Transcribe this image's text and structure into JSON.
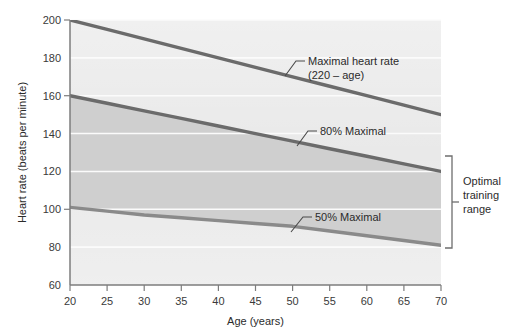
{
  "chart_data": {
    "type": "line",
    "title": "",
    "xlabel": "Age (years)",
    "ylabel": "Heart rate (beats per minute)",
    "xlim": [
      20,
      70
    ],
    "ylim": [
      60,
      200
    ],
    "xticks": [
      20,
      25,
      30,
      35,
      40,
      45,
      50,
      55,
      60,
      65,
      70
    ],
    "yticks": [
      60,
      80,
      100,
      120,
      140,
      160,
      180,
      200
    ],
    "grid": "horizontal-white-gridlines",
    "legend_position": "inline-annotations",
    "x": [
      20,
      25,
      30,
      35,
      40,
      45,
      50,
      55,
      60,
      65,
      70
    ],
    "series": [
      {
        "name": "Maximal heart rate (220 – age)",
        "values": [
          200,
          195,
          190,
          185,
          180,
          175,
          170,
          165,
          160,
          155,
          150
        ],
        "color": "#6b6b6b"
      },
      {
        "name": "80% Maximal",
        "values": [
          160,
          156,
          152,
          148,
          144,
          140,
          136,
          132,
          128,
          124,
          120
        ],
        "color": "#6b6b6b"
      },
      {
        "name": "50% Maximal",
        "values": [
          101,
          99,
          97,
          95.5,
          94,
          92.5,
          91,
          88.5,
          86,
          83.5,
          81
        ],
        "color": "#8a8a8a"
      }
    ],
    "shaded_band": {
      "label": "Optimal training range",
      "upper_series": "80% Maximal",
      "lower_series": "50% Maximal",
      "color": "#cfcfcf"
    },
    "annotations": [
      {
        "text_line1": "Maximal heart rate",
        "text_line2": "(220 – age)",
        "target_series": "Maximal heart rate (220 – age)"
      },
      {
        "text_line1": "80% Maximal",
        "text_line2": "",
        "target_series": "80% Maximal"
      },
      {
        "text_line1": "50% Maximal",
        "text_line2": "",
        "target_series": "50% Maximal"
      }
    ],
    "bracket": {
      "line1": "Optimal",
      "line2": "training",
      "line3": "range"
    }
  },
  "axes": {
    "y_title": "Heart rate (beats per minute)",
    "x_title": "Age (years)",
    "y_tick_200": "200",
    "y_tick_180": "180",
    "y_tick_160": "160",
    "y_tick_140": "140",
    "y_tick_120": "120",
    "y_tick_100": "100",
    "y_tick_80": "80",
    "y_tick_60": "60",
    "x_tick_20": "20",
    "x_tick_25": "25",
    "x_tick_30": "30",
    "x_tick_35": "35",
    "x_tick_40": "40",
    "x_tick_45": "45",
    "x_tick_50": "50",
    "x_tick_55": "55",
    "x_tick_60": "60",
    "x_tick_65": "65",
    "x_tick_70": "70"
  },
  "labels": {
    "maximal_line1": "Maximal heart rate",
    "maximal_line2": "(220 – age)",
    "eighty_percent": "80% Maximal",
    "fifty_percent": "50% Maximal",
    "bracket_line1": "Optimal",
    "bracket_line2": "training",
    "bracket_line3": "range"
  },
  "colors": {
    "plot_background": "#e8e8e8",
    "band_fill": "#cfcfcf",
    "line_dark": "#6b6b6b",
    "line_mid": "#8a8a8a",
    "gridline": "#fafafa",
    "axis": "#7a7a7a",
    "text": "#2b2b2b"
  }
}
